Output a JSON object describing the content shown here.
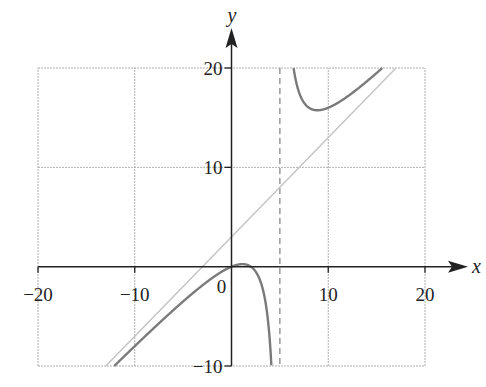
{
  "chart_data": {
    "type": "line",
    "title": "",
    "xlabel": "x",
    "ylabel": "y",
    "xlim": [
      -20,
      20
    ],
    "ylim": [
      -10,
      20
    ],
    "grid": true,
    "x_ticks": [
      -20,
      -10,
      0,
      10,
      20
    ],
    "y_ticks": [
      -10,
      10,
      20
    ],
    "x_tick_labels": [
      "−20",
      "−10",
      "0",
      "10",
      "20"
    ],
    "y_tick_labels": [
      "−10",
      "10",
      "20"
    ],
    "origin_label": "0",
    "series": [
      {
        "name": "f(x) = x(x−2)/(x−5)",
        "expression": "x*(x-2)/(x-5)",
        "style": "solid",
        "color": "#7a7a7a",
        "sample_points": [
          {
            "x": -12,
            "y": -9.88
          },
          {
            "x": -10,
            "y": -8.0
          },
          {
            "x": -5,
            "y": -3.5
          },
          {
            "x": 0,
            "y": 0
          },
          {
            "x": 1.13,
            "y": 0.26
          },
          {
            "x": 2,
            "y": 0
          },
          {
            "x": 4,
            "y": -8.0
          },
          {
            "x": 6.5,
            "y": 19.5
          },
          {
            "x": 8.87,
            "y": 15.75
          },
          {
            "x": 12,
            "y": 17.14
          },
          {
            "x": 15.8,
            "y": 20.0
          }
        ]
      },
      {
        "name": "Slant asymptote y = x + 3",
        "expression": "x+3",
        "style": "solid",
        "color": "#c4c4c4",
        "sample_points": [
          {
            "x": -13,
            "y": -10
          },
          {
            "x": 17,
            "y": 20
          }
        ]
      },
      {
        "name": "Vertical asymptote x = 5",
        "x_value": 5,
        "style": "dashed",
        "color": "#8a8a8a"
      }
    ],
    "colors": {
      "axis": "#222222",
      "grid": "#9a9a9a"
    }
  }
}
